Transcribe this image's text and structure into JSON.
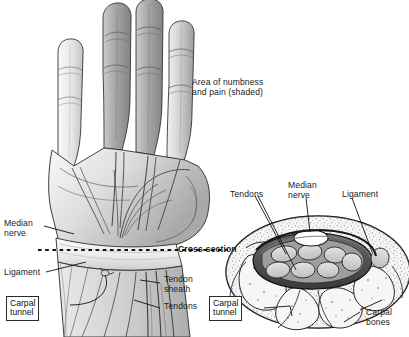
{
  "figure": {
    "background_color": "#ffffff",
    "ink_color": "#1a1a1a"
  },
  "annotations": {
    "numbness_note": "Area of numbness\nand pain (shaded)",
    "cross_section": "Cross-section"
  },
  "hand_labels": {
    "median_nerve": "Median\nnerve",
    "ligament": "Ligament",
    "tendon_sheath": "Tendon\nsheath",
    "tendons": "Tendons",
    "carpal_tunnel": "Carpal\ntunnel"
  },
  "section_labels": {
    "tendons": "Tendons",
    "median_nerve": "Median\nnerve",
    "ligament": "Ligament",
    "carpal_bones": "Carpal\nbones",
    "carpal_tunnel": "Carpal\ntunnel"
  },
  "palette": {
    "skin_light": "#e8e8e8",
    "skin_mid": "#cfcfcf",
    "shaded_finger": "#a8a8a8",
    "shaded_finger_dark": "#8f8f8f",
    "bone_fill": "#efefef",
    "tendon_fill": "#d8d8d8",
    "nerve_fill": "#fbfbfb",
    "tunnel_dark": "#4a4a4a",
    "outline": "#1a1a1a"
  }
}
